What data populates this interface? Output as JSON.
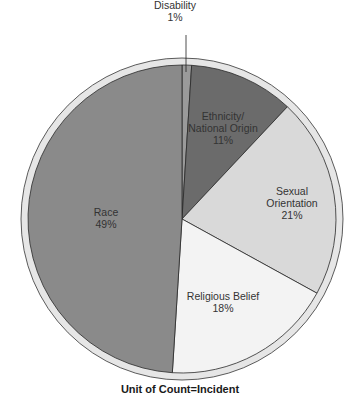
{
  "chart_data": {
    "type": "pie",
    "title": "",
    "caption": "Unit of Count=Incident",
    "start_angle_deg": 0,
    "direction": "clockwise",
    "slices": [
      {
        "label": "Disability",
        "value": 1,
        "display": "1%",
        "color": "#9a9a9a",
        "label_lines": [
          "Disability",
          "1%"
        ],
        "label_pos": [
          175,
          9
        ],
        "leader": true
      },
      {
        "label": "Ethnicity/ National Origin",
        "value": 11,
        "display": "11%",
        "color": "#6b6b6b",
        "label_lines": [
          "Ethnicity/",
          "National Origin",
          "11%"
        ],
        "label_pos": [
          223,
          120
        ]
      },
      {
        "label": "Sexual Orientation",
        "value": 21,
        "display": "21%",
        "color": "#d9d9d9",
        "label_lines": [
          "Sexual",
          "Orientation",
          "21%"
        ],
        "label_pos": [
          292,
          195
        ]
      },
      {
        "label": "Religious Belief",
        "value": 18,
        "display": "18%",
        "color": "#f3f3f3",
        "label_lines": [
          "Religious Belief",
          "18%"
        ],
        "label_pos": [
          223,
          300
        ]
      },
      {
        "label": "Race",
        "value": 49,
        "display": "49%",
        "color": "#8a8a8a",
        "label_lines": [
          "Race",
          "49%"
        ],
        "label_pos": [
          106,
          216
        ]
      }
    ]
  },
  "geometry": {
    "cx": 182,
    "cy": 219,
    "r_outer": 161,
    "r_inner": 154
  },
  "footer": {
    "caption": "Unit of Count=Incident"
  }
}
